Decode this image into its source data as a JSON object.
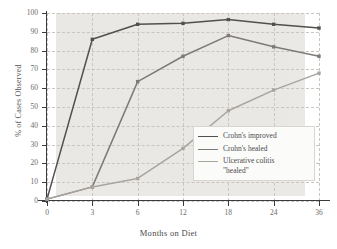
{
  "chart_data": {
    "type": "line",
    "title": "",
    "xlabel": "Months on Diet",
    "ylabel": "% of Cases Observed",
    "categories": [
      "0",
      "3",
      "6",
      "12",
      "18",
      "24",
      "36"
    ],
    "x_tick_labels": [
      "0",
      "3",
      "6",
      "12",
      "18",
      "24",
      "36"
    ],
    "y_tick_labels": [
      "0",
      "10",
      "20",
      "30",
      "40",
      "50",
      "60",
      "70",
      "80",
      "90",
      "100"
    ],
    "ylim": [
      0,
      100
    ],
    "y_major_step": 10,
    "grid": "dashed both axes",
    "legend_position": "inside lower right",
    "axis_scale": "categorical x-axis, evenly spaced ticks",
    "series": [
      {
        "name": "Crohn's improved",
        "color": "#52504e",
        "markers": true,
        "values": [
          1,
          86,
          94,
          94.5,
          96.5,
          94,
          92
        ]
      },
      {
        "name": "Crohn's healed",
        "color": "#7d7a77",
        "markers": true,
        "values": [
          1,
          7.5,
          63.5,
          77,
          88,
          82,
          77
        ]
      },
      {
        "name": "Ulcerative colitis \"healed\"",
        "color": "#a8a5a1",
        "markers": true,
        "values": [
          1,
          7.5,
          12,
          28,
          48,
          59,
          68
        ]
      }
    ]
  },
  "legend": {
    "entries": [
      {
        "label": "Crohn's improved",
        "color": "#52504e"
      },
      {
        "label": "Crohn's healed",
        "color": "#7d7a77"
      },
      {
        "label": "Ulcerative colitis\n\"healed\"",
        "color": "#a8a5a1"
      }
    ]
  },
  "colors": {
    "plot_background": "#ebe9e6",
    "gridline": "#c9c6c2",
    "axis": "#3b3b3b",
    "tick_label": "#6d6a66",
    "page_background": "#ffffff"
  }
}
